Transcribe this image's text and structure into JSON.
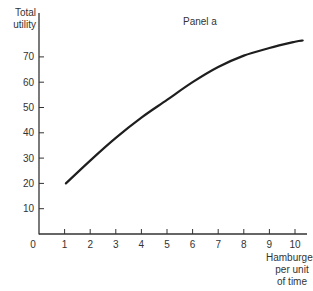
{
  "chart_data": {
    "type": "line",
    "title": "Panel a",
    "xlabel": "Hamburgers per unit of time",
    "ylabel": "Total utility",
    "x_ticks": [
      0,
      1,
      2,
      3,
      4,
      5,
      6,
      7,
      8,
      9,
      10
    ],
    "y_ticks": [
      10,
      20,
      30,
      40,
      50,
      60,
      70
    ],
    "xlim": [
      0,
      10.5
    ],
    "ylim": [
      0,
      80
    ],
    "grid": false,
    "legend": null,
    "series": [
      {
        "name": "Total utility",
        "x": [
          1.05,
          2,
          3,
          4,
          5,
          6,
          7,
          8,
          9,
          10,
          10.3
        ],
        "y": [
          20,
          29,
          38,
          46,
          53,
          60,
          66,
          70.5,
          73.5,
          76,
          76.5
        ]
      }
    ]
  },
  "labels": {
    "title": "Panel a",
    "ylabel_line1": "Total",
    "ylabel_line2": "utility",
    "xlabel_line1": "Hamburgers",
    "xlabel_line2": "per unit",
    "xlabel_line3": "of time",
    "origin": "0"
  },
  "colors": {
    "curve": "#1e1e1e",
    "axis": "#333333",
    "text": "#333333"
  }
}
